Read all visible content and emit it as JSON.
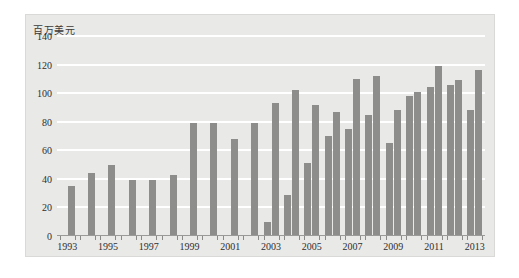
{
  "chart_data": {
    "type": "bar",
    "title": "",
    "subtitle": "",
    "unit_label": "百万美元",
    "xlabel": "",
    "ylabel": "百万美元",
    "ylim": [
      0,
      140
    ],
    "ytick_step": 20,
    "yticks": [
      "140",
      "120",
      "100",
      "80",
      "60",
      "40",
      "20",
      "0"
    ],
    "grid": true,
    "legend_position": "top-left",
    "categories": [
      "1993",
      "1994",
      "1995",
      "1996",
      "1997",
      "1998",
      "1999",
      "2000",
      "2001",
      "2002",
      "2003",
      "2004",
      "2005",
      "2006",
      "2007",
      "2008",
      "2009",
      "2010",
      "2011",
      "2012",
      "2013"
    ],
    "xtick_labels": [
      "1993",
      "1995",
      "1997",
      "1999",
      "2001",
      "2003",
      "2005",
      "2007",
      "2009",
      "2011",
      "2013"
    ],
    "series": [
      {
        "name": "进口",
        "color": "#8d8d8b",
        "values": [
          0,
          0,
          0,
          0,
          0,
          0,
          0,
          0,
          0,
          0,
          10,
          29,
          51,
          70,
          75,
          85,
          65,
          98,
          104,
          106,
          88
        ]
      },
      {
        "name": "出口",
        "color": "#8d8d8b",
        "values": [
          35,
          44,
          50,
          39,
          39,
          43,
          79,
          79,
          68,
          79,
          93,
          102,
          92,
          87,
          110,
          112,
          88,
          101,
          119,
          109,
          116
        ]
      }
    ]
  },
  "legend": {
    "items": [
      {
        "label": "进口"
      },
      {
        "label": "出口"
      }
    ]
  },
  "colors": {
    "bar": "#8d8d8b",
    "panel_background": "#e9e9e7",
    "gridline": "#ffffff",
    "axis": "#9a9a98",
    "text": "#2f2f2f"
  }
}
